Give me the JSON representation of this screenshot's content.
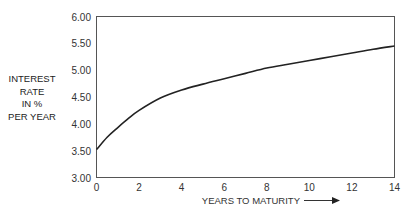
{
  "chart_data": {
    "type": "line",
    "title": "",
    "xlabel": "YEARS TO MATURITY",
    "ylabel_lines": [
      "INTEREST",
      "RATE",
      "IN %",
      "PER YEAR"
    ],
    "ylabel": "INTEREST RATE IN % PER YEAR",
    "xlim": [
      0,
      14
    ],
    "ylim": [
      3.0,
      6.0
    ],
    "x_ticks": [
      "0",
      "2",
      "4",
      "6",
      "8",
      "10",
      "12",
      "14"
    ],
    "y_ticks": [
      "6.00",
      "5.50",
      "5.00",
      "4.50",
      "4.00",
      "3.50",
      "3.00"
    ],
    "grid": false,
    "legend": "none",
    "series": [
      {
        "name": "Yield curve",
        "x": [
          0,
          0.5,
          1,
          1.5,
          2,
          3,
          4,
          5,
          6,
          7,
          8,
          9,
          10,
          11,
          12,
          13,
          14
        ],
        "values": [
          3.52,
          3.75,
          3.93,
          4.1,
          4.25,
          4.48,
          4.63,
          4.74,
          4.84,
          4.94,
          5.04,
          5.11,
          5.18,
          5.25,
          5.32,
          5.39,
          5.45
        ]
      }
    ]
  }
}
